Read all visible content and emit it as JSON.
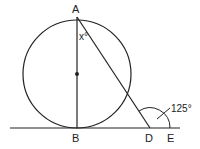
{
  "diagram": {
    "type": "geometry",
    "points": {
      "A": {
        "label": "A",
        "x": 77,
        "y": 17
      },
      "B": {
        "label": "B",
        "x": 77,
        "y": 128
      },
      "D": {
        "label": "D",
        "x": 150,
        "y": 128
      },
      "E": {
        "label": "E",
        "x": 172,
        "y": 128
      },
      "center": {
        "x": 77,
        "y": 74
      }
    },
    "circle": {
      "cx": 77,
      "cy": 74,
      "r": 54
    },
    "angle_labels": {
      "x": "x°",
      "exterior": "125°"
    },
    "colors": {
      "stroke": "#222222",
      "background": "#ffffff"
    }
  }
}
